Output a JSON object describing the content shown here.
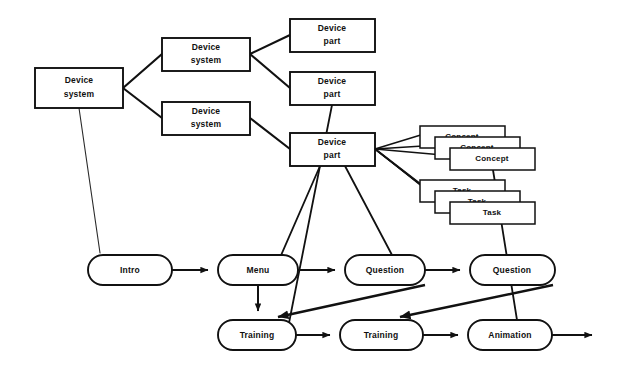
{
  "diagram": {
    "background_color": "#ffffff",
    "line_color": "#111111",
    "text_color": "#101010",
    "tree": {
      "root": {
        "id": "root-device-system",
        "label_line1": "Device",
        "label_line2": "system",
        "x": 35,
        "y": 68,
        "w": 88,
        "h": 40
      },
      "systems": [
        {
          "id": "device-system-upper",
          "label_line1": "Device",
          "label_line2": "system",
          "x": 162,
          "y": 38,
          "w": 88,
          "h": 33
        },
        {
          "id": "device-system-lower",
          "label_line1": "Device",
          "label_line2": "system",
          "x": 162,
          "y": 102,
          "w": 88,
          "h": 33
        }
      ],
      "parts": [
        {
          "id": "device-part-1",
          "label_line1": "Device",
          "label_line2": "part",
          "x": 290,
          "y": 19,
          "w": 85,
          "h": 33
        },
        {
          "id": "device-part-2",
          "label_line1": "Device",
          "label_line2": "part",
          "x": 290,
          "y": 72,
          "w": 85,
          "h": 33
        },
        {
          "id": "device-part-3",
          "label_line1": "Device",
          "label_line2": "part",
          "x": 290,
          "y": 133,
          "w": 85,
          "h": 33
        }
      ]
    },
    "stacks": [
      {
        "id": "concept-stack",
        "label": "Concept",
        "count": 3,
        "x": 420,
        "y": 126,
        "w": 85,
        "h": 22,
        "offset_x": 15,
        "offset_y": 11
      },
      {
        "id": "task-stack",
        "label": "Task",
        "count": 3,
        "x": 420,
        "y": 180,
        "w": 85,
        "h": 22,
        "offset_x": 15,
        "offset_y": 11
      }
    ],
    "flow_nodes": [
      {
        "id": "flow-intro",
        "label": "Intro",
        "x": 88,
        "y": 255,
        "w": 84,
        "h": 30
      },
      {
        "id": "flow-menu",
        "label": "Menu",
        "x": 218,
        "y": 255,
        "w": 80,
        "h": 30
      },
      {
        "id": "flow-question-1",
        "label": "Question",
        "x": 345,
        "y": 255,
        "w": 80,
        "h": 30
      },
      {
        "id": "flow-question-2",
        "label": "Question",
        "x": 470,
        "y": 255,
        "w": 85,
        "h": 30
      },
      {
        "id": "flow-training-1",
        "label": "Training",
        "x": 218,
        "y": 320,
        "w": 78,
        "h": 30
      },
      {
        "id": "flow-training-2",
        "label": "Training",
        "x": 340,
        "y": 320,
        "w": 83,
        "h": 30
      },
      {
        "id": "flow-animation",
        "label": "Animation",
        "x": 468,
        "y": 320,
        "w": 84,
        "h": 30
      }
    ]
  }
}
